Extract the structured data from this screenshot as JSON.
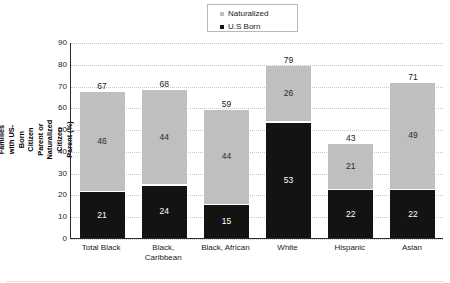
{
  "chart_data": {
    "type": "bar",
    "subtype": "stacked-bar",
    "title": "",
    "xlabel": "",
    "ylabel": "Share of Children (0-10) in Immigrant Families with US-Born Citizen Parent or Naturalized Citizen Parent (%)",
    "ylim": [
      0,
      90
    ],
    "ytick_step": 10,
    "yticks": [
      90,
      80,
      70,
      60,
      50,
      40,
      30,
      20,
      10,
      0
    ],
    "grid": true,
    "grid_style": "dotted-horizontal",
    "legend_position": "top-center",
    "categories": [
      "Total Black",
      "Black, Caribbean",
      "Black, African",
      "White",
      "Hispanic",
      "Asian"
    ],
    "series": [
      {
        "name": "Naturalized",
        "color": "#bfbfbf",
        "values": [
          46,
          44,
          44,
          26,
          21,
          49
        ]
      },
      {
        "name": "U.S Born",
        "color": "#131313",
        "values": [
          21,
          24,
          15,
          53,
          22,
          22
        ]
      }
    ],
    "totals": [
      67,
      68,
      59,
      79,
      43,
      71
    ],
    "stack_order": [
      "U.S Born",
      "Naturalized"
    ]
  },
  "legend": {
    "items": [
      {
        "label": "Naturalized",
        "color": "#bfbfbf",
        "marker": "square-marker"
      },
      {
        "label": "U.S Born",
        "color": "#131313",
        "marker": "square-marker"
      }
    ]
  },
  "axis": {
    "y_title_lines": [
      "Share of Children (0-10) in Immigrant Families",
      "with US-Born Citizen Parent or Naturalized",
      "Citizen Parent (%)"
    ]
  }
}
